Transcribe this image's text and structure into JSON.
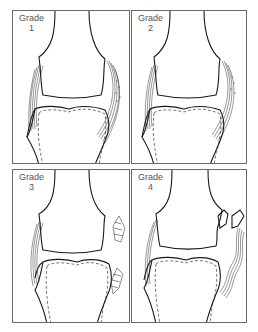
{
  "figure": {
    "panels": [
      {
        "label": "Grade",
        "number": "1",
        "description": "Ligament intact with minor fiber damage (stippled area)"
      },
      {
        "label": "Grade",
        "number": "2",
        "description": "Partial tear of collateral ligament fibers"
      },
      {
        "label": "Grade",
        "number": "3",
        "description": "Complete rupture of ligament"
      },
      {
        "label": "Grade",
        "number": "4",
        "description": "Rupture with avulsed bone fragment"
      }
    ]
  },
  "colors": {
    "line": "#1a1a1a",
    "border": "#6a6a6a",
    "label": "#555555",
    "background": "#ffffff"
  }
}
